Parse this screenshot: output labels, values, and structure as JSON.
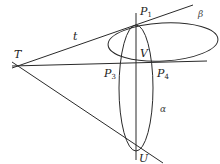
{
  "diagram": {
    "title": "",
    "stroke_color": "#2a2a2a",
    "background": "#ffffff",
    "points": {
      "T": {
        "label": "T",
        "x": 17,
        "y": 65
      },
      "P1": {
        "label": "P",
        "sub": "1",
        "x": 136,
        "y": 25
      },
      "V": {
        "label": "V",
        "x": 136,
        "y": 62
      },
      "P3": {
        "label": "P",
        "sub": "3",
        "x": 121,
        "y": 63
      },
      "P4": {
        "label": "P",
        "sub": "4",
        "x": 155,
        "y": 62
      },
      "U": {
        "label": "U",
        "x": 136,
        "y": 150
      }
    },
    "lines": {
      "t": {
        "label": "t",
        "from": [
          12,
          68
        ],
        "to": [
          193,
          5
        ]
      },
      "horizontal": {
        "from": [
          12,
          66
        ],
        "to": [
          207,
          61
        ]
      },
      "lower_tangent": {
        "from": [
          12,
          62
        ],
        "to": [
          163,
          163
        ]
      },
      "vertical": {
        "from": [
          136,
          13
        ],
        "to": [
          136,
          160
        ]
      }
    },
    "curves": {
      "beta": {
        "label": "β",
        "type": "ellipse",
        "cx": 163,
        "cy": 42,
        "rx": 55,
        "ry": 19,
        "rotate": -3
      },
      "alpha": {
        "label": "α",
        "type": "ellipse",
        "cx": 136,
        "cy": 88,
        "rx": 17,
        "ry": 63,
        "rotate": 0
      }
    },
    "labels": {
      "T": "T",
      "t": "t",
      "P": "P",
      "P1_sub": "1",
      "P3_sub": "3",
      "P4_sub": "4",
      "V": "V",
      "U": "U",
      "beta": "β",
      "alpha": "α"
    }
  }
}
